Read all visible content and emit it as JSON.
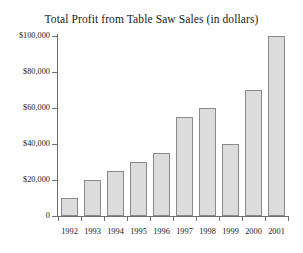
{
  "chart_data": {
    "type": "bar",
    "title": "Total Profit from Table Saw Sales (in dollars)",
    "xlabel": "",
    "ylabel": "",
    "categories": [
      "1992",
      "1993",
      "1994",
      "1995",
      "1996",
      "1997",
      "1998",
      "1999",
      "2000",
      "2001"
    ],
    "values": [
      10000,
      20000,
      25000,
      30000,
      35000,
      55000,
      60000,
      40000,
      70000,
      100000
    ],
    "ylim": [
      0,
      100000
    ],
    "y_ticks": [
      0,
      20000,
      40000,
      60000,
      80000,
      100000
    ],
    "y_tick_labels": [
      "0",
      "$20,000",
      "$40,000",
      "$60,000",
      "$80,000",
      "$100,000"
    ],
    "grid": false,
    "legend": null,
    "series": [
      {
        "name": "Total Profit",
        "values": [
          10000,
          20000,
          25000,
          30000,
          35000,
          55000,
          60000,
          40000,
          70000,
          100000
        ]
      }
    ],
    "colors": {
      "bar_fill": "#dcdcdc",
      "bar_border": "#8a8a8a",
      "axis": "#6e6e6e",
      "text": "#1a1a1a",
      "background": "#ffffff"
    }
  }
}
